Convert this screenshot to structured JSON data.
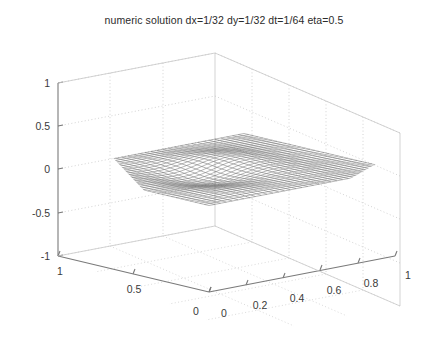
{
  "figure": {
    "title": "numeric solution dx=1/32 dy=1/32 dt=1/64 eta=0.5",
    "background_color": "#ffffff",
    "axis_color": "#7a7a7a",
    "grid_color": "#c8c8c8",
    "mesh_color": "#4a4a4a",
    "text_color": "#3a3a3a"
  },
  "chart_data": {
    "type": "surface",
    "title": "numeric solution dx=1/32 dy=1/32 dt=1/64 eta=0.5",
    "xlabel": "",
    "ylabel": "",
    "zlabel": "",
    "xlim": [
      0,
      1
    ],
    "ylim": [
      0,
      1
    ],
    "zlim": [
      -1,
      1
    ],
    "grid": true,
    "legend": "none",
    "projection": "3d-mesh-wireframe",
    "grid_resolution": {
      "nx": 32,
      "ny": 32
    },
    "parameters": {
      "dx": "1/32",
      "dy": "1/32",
      "dt": "1/64",
      "eta": "0.5"
    },
    "x_ticks": [
      0,
      0.2,
      0.4,
      0.6,
      0.8,
      1
    ],
    "x_tick_labels": [
      "0",
      "0.2",
      "0.4",
      "0.6",
      "0.8",
      "1"
    ],
    "y_ticks": [
      0,
      0.5,
      1
    ],
    "y_tick_labels": [
      "0",
      "0.5",
      "1"
    ],
    "z_ticks": [
      -1,
      -0.5,
      0,
      0.5,
      1
    ],
    "z_tick_labels": [
      "-1",
      "-0.5",
      "0",
      "0.5",
      "1"
    ],
    "surface_description": "near-flat rippled numeric solution surface centered at z=0 with small amplitude oscillations",
    "z_amplitude_range": [
      -0.09,
      0.09
    ],
    "z_mean": 0.0
  },
  "ticks": {
    "z": [
      {
        "label": "1",
        "value": 1
      },
      {
        "label": "0.5",
        "value": 0.5
      },
      {
        "label": "0",
        "value": 0
      },
      {
        "label": "-0.5",
        "value": -0.5
      },
      {
        "label": "-1",
        "value": -1
      }
    ],
    "y": [
      {
        "label": "1",
        "value": 1
      },
      {
        "label": "0.5",
        "value": 0.5
      },
      {
        "label": "0",
        "value": 0
      }
    ],
    "x": [
      {
        "label": "0",
        "value": 0
      },
      {
        "label": "0.2",
        "value": 0.2
      },
      {
        "label": "0.4",
        "value": 0.4
      },
      {
        "label": "0.6",
        "value": 0.6
      },
      {
        "label": "0.8",
        "value": 0.8
      },
      {
        "label": "1",
        "value": 1
      }
    ]
  }
}
